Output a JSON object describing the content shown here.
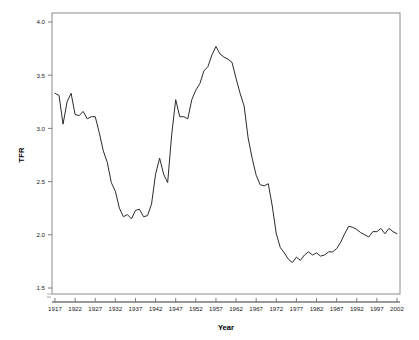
{
  "chart_data": {
    "type": "line",
    "title": "",
    "xlabel": "Year",
    "ylabel": "TFR",
    "xlim": [
      1917,
      2002
    ],
    "ylim": [
      1.5,
      4.0
    ],
    "grid": false,
    "legend": null,
    "y_ticks": [
      "4.0",
      "3.5",
      "3.0",
      "2.5",
      "2.0",
      "1.5"
    ],
    "y_tick_values": [
      4.0,
      3.5,
      3.0,
      2.5,
      2.0,
      1.5
    ],
    "x_ticks": [
      "1917",
      "1922",
      "1927",
      "1932",
      "1937",
      "1942",
      "1947",
      "1952",
      "1957",
      "1962",
      "1967",
      "1972",
      "1977",
      "1982",
      "1987",
      "1992",
      "1997",
      "2002"
    ],
    "x_tick_values": [
      1917,
      1922,
      1927,
      1932,
      1937,
      1942,
      1947,
      1952,
      1957,
      1962,
      1967,
      1972,
      1977,
      1982,
      1987,
      1992,
      1997,
      2002
    ],
    "line_color": "#2b2b2b",
    "x": [
      1917,
      1918,
      1919,
      1920,
      1921,
      1922,
      1923,
      1924,
      1925,
      1926,
      1927,
      1928,
      1929,
      1930,
      1931,
      1932,
      1933,
      1934,
      1935,
      1936,
      1937,
      1938,
      1939,
      1940,
      1941,
      1942,
      1943,
      1944,
      1945,
      1946,
      1947,
      1948,
      1949,
      1950,
      1951,
      1952,
      1953,
      1954,
      1955,
      1956,
      1957,
      1958,
      1959,
      1960,
      1961,
      1962,
      1963,
      1964,
      1965,
      1966,
      1967,
      1968,
      1969,
      1970,
      1971,
      1972,
      1973,
      1974,
      1975,
      1976,
      1977,
      1978,
      1979,
      1980,
      1981,
      1982,
      1983,
      1984,
      1985,
      1986,
      1987,
      1988,
      1989,
      1990,
      1991,
      1992,
      1993,
      1994,
      1995,
      1996,
      1997,
      1998,
      1999,
      2000,
      2001,
      2002
    ],
    "y": [
      3.33,
      3.31,
      3.04,
      3.25,
      3.33,
      3.13,
      3.12,
      3.16,
      3.09,
      3.11,
      3.11,
      2.96,
      2.79,
      2.68,
      2.49,
      2.41,
      2.25,
      2.17,
      2.19,
      2.15,
      2.23,
      2.24,
      2.17,
      2.18,
      2.29,
      2.57,
      2.72,
      2.57,
      2.49,
      2.94,
      3.27,
      3.11,
      3.11,
      3.09,
      3.27,
      3.36,
      3.42,
      3.54,
      3.58,
      3.69,
      3.77,
      3.7,
      3.67,
      3.65,
      3.62,
      3.47,
      3.33,
      3.21,
      2.91,
      2.72,
      2.56,
      2.47,
      2.46,
      2.48,
      2.27,
      2.01,
      1.88,
      1.83,
      1.77,
      1.74,
      1.79,
      1.76,
      1.81,
      1.84,
      1.81,
      1.83,
      1.8,
      1.81,
      1.84,
      1.84,
      1.87,
      1.93,
      2.01,
      2.08,
      2.07,
      2.05,
      2.02,
      2.0,
      1.98,
      2.03,
      2.03,
      2.06,
      2.01,
      2.06,
      2.03,
      2.01
    ]
  }
}
